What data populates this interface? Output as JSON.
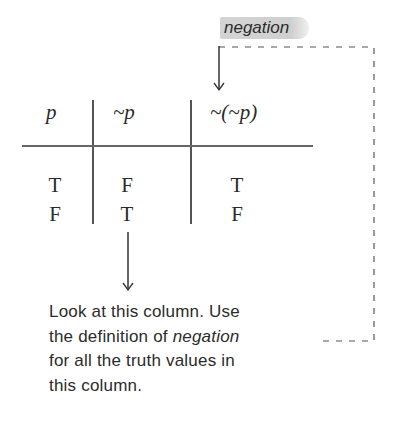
{
  "callout": {
    "label": "negation",
    "highlight_color": "#cfcfcf"
  },
  "truth_table": {
    "headers": [
      "p",
      "~p",
      "~(~p)"
    ],
    "rows": [
      [
        "T",
        "F",
        "T"
      ],
      [
        "F",
        "T",
        "F"
      ]
    ]
  },
  "note": {
    "line1": "Look at this column. Use",
    "line2_prefix": "the definition of ",
    "line2_emphasis": "negation",
    "line3": "for all the truth values in",
    "line4": "this column."
  }
}
